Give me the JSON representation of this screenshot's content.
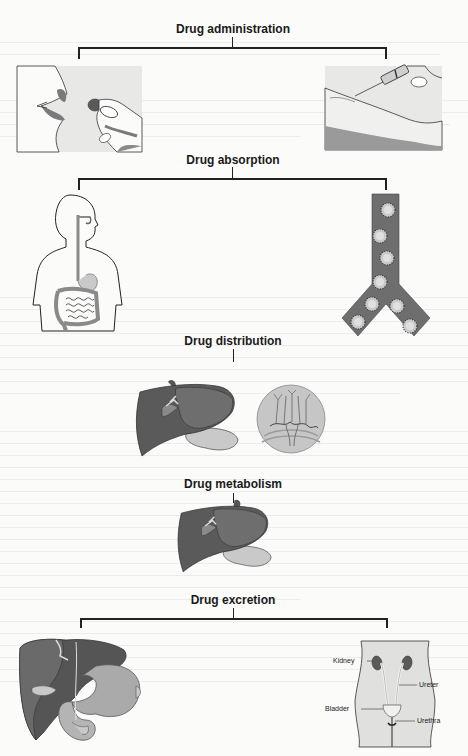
{
  "diagram": {
    "stages": [
      {
        "title": "Drug administration",
        "images": [
          "oral-administration-illustration",
          "injection-administration-illustration"
        ]
      },
      {
        "title": "Drug absorption",
        "images": [
          "digestive-system-illustration",
          "blood-vessel-with-drug-particles-illustration"
        ]
      },
      {
        "title": "Drug distribution",
        "images": [
          "liver-illustration",
          "tissue-capillary-circle-illustration"
        ]
      },
      {
        "title": "Drug metabolism",
        "images": [
          "liver-illustration"
        ]
      },
      {
        "title": "Drug excretion",
        "images": [
          "liver-gallbladder-intestine-illustration",
          "urinary-system-illustration"
        ]
      }
    ],
    "urinary_labels": {
      "kidney": "Kidney",
      "ureter": "Ureter",
      "bladder": "Bladder",
      "urethra": "Urethra"
    }
  },
  "colors": {
    "line": "#222222",
    "organ_dark": "#555555",
    "organ_mid": "#8a8a8a",
    "organ_light": "#c9c9c9",
    "panel_bg": "#e6e6e6"
  }
}
